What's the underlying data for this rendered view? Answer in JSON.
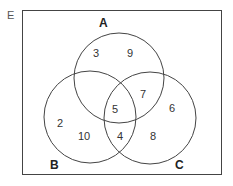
{
  "diagram": {
    "type": "venn",
    "universe_label": "E",
    "sets": [
      {
        "label": "A"
      },
      {
        "label": "B"
      },
      {
        "label": "C"
      }
    ],
    "regions": {
      "a_only_left": "3",
      "a_only_right": "9",
      "a_and_c": "7",
      "a_b_c": "5",
      "b_only_left": "2",
      "b_only_right": "10",
      "b_and_c": "4",
      "c_only_upper": "6",
      "c_only_lower": "8"
    }
  }
}
